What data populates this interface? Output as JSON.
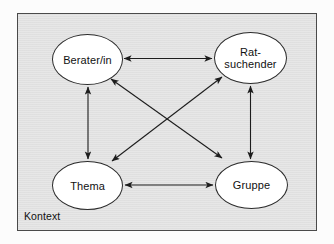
{
  "figure": {
    "type": "concept-diagram",
    "frame_label": "Kontext",
    "background_color": "#e3e3e3",
    "node_fill_color": "#ffffff",
    "line_color": "#2b2b2b"
  },
  "nodes": [
    {
      "id": "berater",
      "label": "Berater/in",
      "position": "top-left"
    },
    {
      "id": "ratsuchender",
      "label": "Rat-\nsuchender",
      "position": "top-right"
    },
    {
      "id": "thema",
      "label": "Thema",
      "position": "bottom-left"
    },
    {
      "id": "gruppe",
      "label": "Gruppe",
      "position": "bottom-right"
    }
  ],
  "edges": [
    {
      "from": "berater",
      "to": "ratsuchender",
      "style": "double-arrow",
      "orientation": "horizontal-top"
    },
    {
      "from": "thema",
      "to": "gruppe",
      "style": "double-arrow",
      "orientation": "horizontal-bottom"
    },
    {
      "from": "berater",
      "to": "thema",
      "style": "double-arrow",
      "orientation": "vertical-left"
    },
    {
      "from": "ratsuchender",
      "to": "gruppe",
      "style": "double-arrow",
      "orientation": "vertical-right"
    },
    {
      "from": "berater",
      "to": "gruppe",
      "style": "double-arrow",
      "orientation": "diagonal-down-right"
    },
    {
      "from": "ratsuchender",
      "to": "thema",
      "style": "double-arrow",
      "orientation": "diagonal-down-left"
    }
  ]
}
